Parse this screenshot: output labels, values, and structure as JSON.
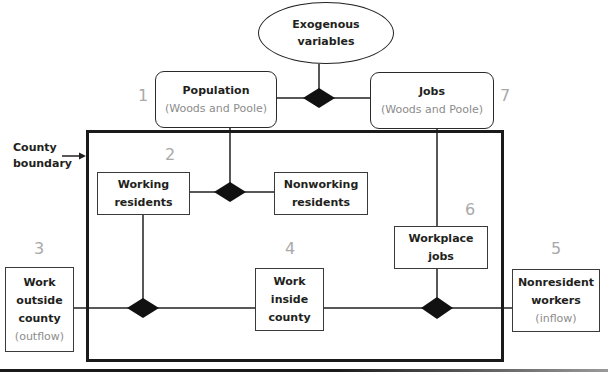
{
  "exogenous": {
    "line1": "Exogenous",
    "line2": "variables"
  },
  "county_boundary": {
    "line1": "County",
    "line2": "boundary"
  },
  "nodes": {
    "population": {
      "number": "1",
      "title": "Population",
      "source": "(Woods and Poole)"
    },
    "working_residents": {
      "number": "2",
      "line1": "Working",
      "line2": "residents"
    },
    "nonworking_residents": {
      "line1": "Nonworking",
      "line2": "residents"
    },
    "work_outside": {
      "number": "3",
      "line1": "Work",
      "line2": "outside",
      "line3": "county",
      "note": "(outflow)"
    },
    "work_inside": {
      "number": "4",
      "line1": "Work",
      "line2": "inside",
      "line3": "county"
    },
    "nonresident_workers": {
      "number": "5",
      "line1": "Nonresident",
      "line2": "workers",
      "note": "(inflow)"
    },
    "workplace_jobs": {
      "number": "6",
      "line1": "Workplace",
      "line2": "jobs"
    },
    "jobs": {
      "number": "7",
      "title": "Jobs",
      "source": "(Woods and Poole)"
    }
  },
  "colors": {
    "line": "#231f20",
    "number": "#a9a9a9",
    "subtext": "#8c8c8c"
  }
}
